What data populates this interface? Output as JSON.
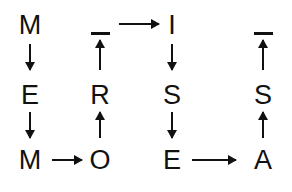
{
  "diagram": {
    "type": "letter-flow-grid",
    "columns": 4,
    "rows": 3,
    "ink_color": "#111111",
    "background_color": "#ffffff",
    "nodes": [
      {
        "id": "n-r0c0",
        "label": "M",
        "row": 0,
        "col": 0,
        "x": 10,
        "y": 10,
        "kind": "letter"
      },
      {
        "id": "n-r1c0",
        "label": "E",
        "row": 1,
        "col": 0,
        "x": 10,
        "y": 80,
        "kind": "letter"
      },
      {
        "id": "n-r2c0",
        "label": "M",
        "row": 2,
        "col": 0,
        "x": 10,
        "y": 145,
        "kind": "letter"
      },
      {
        "id": "n-r0c1",
        "label": "—",
        "row": 0,
        "col": 1,
        "x": 80,
        "y": 10,
        "kind": "bar"
      },
      {
        "id": "n-r1c1",
        "label": "R",
        "row": 1,
        "col": 1,
        "x": 80,
        "y": 80,
        "kind": "letter"
      },
      {
        "id": "n-r2c1",
        "label": "O",
        "row": 2,
        "col": 1,
        "x": 80,
        "y": 145,
        "kind": "letter"
      },
      {
        "id": "n-r0c2",
        "label": "I",
        "row": 0,
        "col": 2,
        "x": 152,
        "y": 10,
        "kind": "letter"
      },
      {
        "id": "n-r1c2",
        "label": "S",
        "row": 1,
        "col": 2,
        "x": 152,
        "y": 80,
        "kind": "letter"
      },
      {
        "id": "n-r2c2",
        "label": "E",
        "row": 2,
        "col": 2,
        "x": 152,
        "y": 145,
        "kind": "letter"
      },
      {
        "id": "n-r0c3",
        "label": "—",
        "row": 0,
        "col": 3,
        "x": 243,
        "y": 10,
        "kind": "bar"
      },
      {
        "id": "n-r1c3",
        "label": "S",
        "row": 1,
        "col": 3,
        "x": 243,
        "y": 80,
        "kind": "letter"
      },
      {
        "id": "n-r2c3",
        "label": "A",
        "row": 2,
        "col": 3,
        "x": 243,
        "y": 145,
        "kind": "letter"
      }
    ],
    "edges": [
      {
        "id": "e-m-to-e",
        "from": "n-r0c0",
        "to": "n-r1c0",
        "direction": "down",
        "orientation": "vertical"
      },
      {
        "id": "e-e-to-m",
        "from": "n-r1c0",
        "to": "n-r2c0",
        "direction": "down",
        "orientation": "vertical"
      },
      {
        "id": "e-m-to-o",
        "from": "n-r2c0",
        "to": "n-r2c1",
        "direction": "right",
        "orientation": "horizontal"
      },
      {
        "id": "e-o-to-r",
        "from": "n-r2c1",
        "to": "n-r1c1",
        "direction": "up",
        "orientation": "vertical"
      },
      {
        "id": "e-r-to-bar",
        "from": "n-r1c1",
        "to": "n-r0c1",
        "direction": "up",
        "orientation": "vertical"
      },
      {
        "id": "e-bar-to-i",
        "from": "n-r0c1",
        "to": "n-r0c2",
        "direction": "right",
        "orientation": "horizontal"
      },
      {
        "id": "e-i-to-s",
        "from": "n-r0c2",
        "to": "n-r1c2",
        "direction": "down",
        "orientation": "vertical"
      },
      {
        "id": "e-s-to-e",
        "from": "n-r1c2",
        "to": "n-r2c2",
        "direction": "down",
        "orientation": "vertical"
      },
      {
        "id": "e-e-to-a",
        "from": "n-r2c2",
        "to": "n-r2c3",
        "direction": "right",
        "orientation": "horizontal"
      },
      {
        "id": "e-a-to-s",
        "from": "n-r2c3",
        "to": "n-r1c3",
        "direction": "up",
        "orientation": "vertical"
      },
      {
        "id": "e-s-to-bar",
        "from": "n-r1c3",
        "to": "n-r0c3",
        "direction": "up",
        "orientation": "vertical"
      }
    ],
    "path_reading": "M E M O R - I S E A -"
  }
}
